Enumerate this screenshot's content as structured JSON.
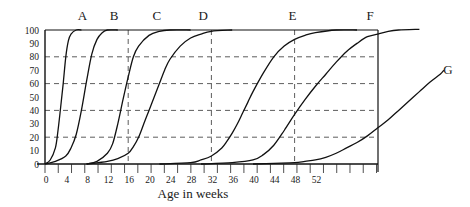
{
  "chart_data": {
    "type": "line",
    "title": "",
    "xlabel": "Age in weeks",
    "ylabel": "",
    "xlim": [
      0,
      64
    ],
    "ylim": [
      0,
      100
    ],
    "x_ticks": [
      0,
      4,
      8,
      12,
      16,
      20,
      24,
      28,
      32,
      36,
      40,
      44,
      48,
      52
    ],
    "y_ticks": [
      0,
      10,
      20,
      30,
      40,
      50,
      60,
      70,
      80,
      90,
      100
    ],
    "grid": {
      "horizontal_dashed": [
        20,
        40,
        60,
        80
      ],
      "vertical_dashed": [
        16,
        32,
        48
      ]
    },
    "legend": "none (curves labelled directly above plot)",
    "series": [
      {
        "name": "A",
        "x": [
          0,
          1,
          2,
          2.5,
          3,
          3.5,
          4,
          4.5,
          5,
          6,
          7
        ],
        "values": [
          0,
          3,
          12,
          25,
          42,
          60,
          80,
          92,
          97,
          100,
          100
        ]
      },
      {
        "name": "B",
        "x": [
          0,
          2,
          4,
          5,
          6,
          7,
          8,
          9,
          10,
          11,
          12,
          14
        ],
        "values": [
          0,
          2,
          6,
          12,
          22,
          40,
          62,
          82,
          93,
          98,
          100,
          100
        ]
      },
      {
        "name": "C",
        "x": [
          8,
          10,
          12,
          13,
          14,
          15,
          16,
          17,
          18,
          20,
          22,
          24,
          28
        ],
        "values": [
          0,
          2,
          8,
          15,
          30,
          48,
          65,
          80,
          88,
          96,
          99,
          100,
          100
        ]
      },
      {
        "name": "D",
        "x": [
          8,
          12,
          14,
          16,
          17,
          18,
          19,
          20,
          21,
          22,
          23,
          24,
          26,
          28,
          30,
          32,
          36
        ],
        "values": [
          0,
          2,
          4,
          8,
          13,
          20,
          30,
          40,
          50,
          60,
          70,
          78,
          88,
          94,
          97,
          99,
          100
        ]
      },
      {
        "name": "E",
        "x": [
          22,
          28,
          30,
          32,
          34,
          35,
          36,
          37,
          38,
          39,
          40,
          42,
          44,
          46,
          48,
          50,
          52,
          56,
          60
        ],
        "values": [
          0,
          1,
          3,
          6,
          12,
          17,
          23,
          30,
          38,
          46,
          54,
          68,
          80,
          88,
          93,
          96,
          98,
          100,
          100
        ]
      },
      {
        "name": "F",
        "x": [
          30,
          36,
          40,
          42,
          44,
          46,
          48,
          50,
          52,
          54,
          56,
          58,
          60,
          62,
          64,
          66,
          68,
          72
        ],
        "values": [
          0,
          1,
          3,
          7,
          14,
          25,
          37,
          48,
          58,
          67,
          76,
          84,
          90,
          95,
          97,
          99,
          100,
          101
        ]
      },
      {
        "name": "G",
        "x": [
          40,
          44,
          48,
          50,
          52,
          54,
          56,
          58,
          60,
          62,
          64,
          66,
          68,
          70,
          72,
          74,
          76,
          76.7
        ],
        "values": [
          0,
          0.5,
          1,
          2,
          3,
          5,
          8,
          12,
          16,
          21,
          27,
          33,
          40,
          47,
          54,
          61,
          67,
          70
        ]
      }
    ],
    "curve_labels": [
      {
        "text": "A",
        "x_week": 7.2
      },
      {
        "text": "B",
        "x_week": 13.3
      },
      {
        "text": "C",
        "x_week": 21.5
      },
      {
        "text": "D",
        "x_week": 30.4
      },
      {
        "text": "E",
        "x_week": 47.6
      },
      {
        "text": "F",
        "x_week": 62.5
      },
      {
        "text": "G",
        "x_week": 77.5,
        "y_value": 67
      }
    ]
  },
  "axis": {
    "xlabel": "Age in weeks",
    "x_tick_labels": [
      "0",
      "4",
      "8",
      "12",
      "16",
      "20",
      "24",
      "28",
      "32",
      "36",
      "40",
      "44",
      "48",
      "52"
    ],
    "y_tick_labels": [
      "0",
      "10",
      "20",
      "30",
      "40",
      "50",
      "60",
      "70",
      "80",
      "90",
      "100"
    ]
  }
}
